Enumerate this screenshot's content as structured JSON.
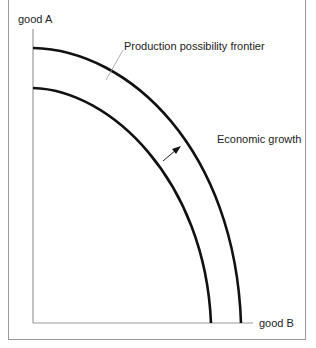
{
  "diagram": {
    "y_axis_label": "good A",
    "x_axis_label": "good B",
    "curves": [
      {
        "name": "Original PPF",
        "y_intercept_px": 88,
        "x_intercept_px": 211
      },
      {
        "name": "Production possibility frontier",
        "y_intercept_px": 48,
        "x_intercept_px": 241
      }
    ],
    "annotations": {
      "ppf_label": "Production possibility frontier",
      "growth_label": "Economic growth"
    },
    "colors": {
      "curve": "#111111",
      "axis": "#999999",
      "frame": "#9a9a9a",
      "text": "#222222"
    }
  }
}
